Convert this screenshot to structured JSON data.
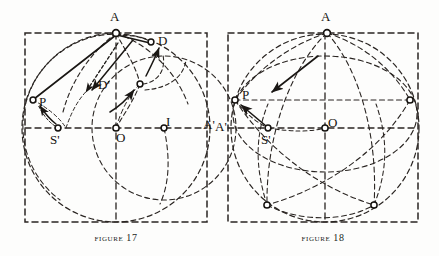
{
  "page": {
    "background_color": "#fdfdfc",
    "ink_color": "#1a1714",
    "width": 439,
    "height": 256
  },
  "figures": [
    {
      "id": "figure-17",
      "caption_word": "Figure",
      "caption_number": "17",
      "caption_text": "Figure 17",
      "box": {
        "x": 25,
        "y": 33,
        "width": 182,
        "height": 189
      },
      "labels": [
        {
          "name": "label-a",
          "text": "A",
          "x": 110,
          "y": 10
        },
        {
          "name": "label-d",
          "text": "D",
          "x": 158,
          "y": 34
        },
        {
          "name": "label-d-prime",
          "text": "D'",
          "x": 98,
          "y": 78
        },
        {
          "name": "label-p",
          "text": "P",
          "x": 39,
          "y": 95
        },
        {
          "name": "label-s-prime",
          "text": "S'",
          "x": 50,
          "y": 133
        },
        {
          "name": "label-o",
          "text": "O",
          "x": 116,
          "y": 131
        },
        {
          "name": "label-i",
          "text": "I",
          "x": 166,
          "y": 115
        },
        {
          "name": "label-a-prime",
          "text": "A'",
          "x": 203,
          "y": 118
        }
      ],
      "points": [
        {
          "name": "point-a",
          "x": 116,
          "y": 33
        },
        {
          "name": "point-d",
          "x": 151,
          "y": 42
        },
        {
          "name": "point-d-prime",
          "x": 140,
          "y": 84
        },
        {
          "name": "point-p",
          "x": 33,
          "y": 100
        },
        {
          "name": "point-s-prime",
          "x": 58,
          "y": 128
        },
        {
          "name": "point-o",
          "x": 116,
          "y": 128
        },
        {
          "name": "point-i",
          "x": 164,
          "y": 128
        }
      ]
    },
    {
      "id": "figure-18",
      "caption_word": "Figure",
      "caption_number": "18",
      "caption_text": "Figure 18",
      "box": {
        "x": 228,
        "y": 33,
        "width": 190,
        "height": 189
      },
      "labels": [
        {
          "name": "label-a",
          "text": "A",
          "x": 321,
          "y": 10
        },
        {
          "name": "label-p",
          "text": "P",
          "x": 242,
          "y": 88
        },
        {
          "name": "label-s-prime",
          "text": "S'",
          "x": 261,
          "y": 133
        },
        {
          "name": "label-o",
          "text": "O",
          "x": 328,
          "y": 116
        },
        {
          "name": "label-a-prime",
          "text": "A'",
          "x": 215,
          "y": 120
        }
      ],
      "points": [
        {
          "name": "point-a",
          "x": 327,
          "y": 33
        },
        {
          "name": "point-p",
          "x": 235,
          "y": 100
        },
        {
          "name": "point-s-prime",
          "x": 268,
          "y": 128
        },
        {
          "name": "point-o",
          "x": 325,
          "y": 128
        },
        {
          "name": "point-right",
          "x": 410,
          "y": 100
        },
        {
          "name": "point-bottom-left",
          "x": 267,
          "y": 205
        },
        {
          "name": "point-bottom-right",
          "x": 374,
          "y": 205
        }
      ]
    }
  ]
}
